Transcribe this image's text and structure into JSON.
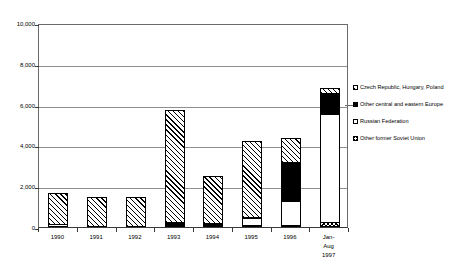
{
  "chart_data": {
    "type": "bar",
    "stacked": true,
    "title": "",
    "subtitle": "",
    "xlabel": "",
    "ylabel": "",
    "ylim": [
      0,
      10000
    ],
    "grid": true,
    "legend_position": "right",
    "categories": [
      "1990",
      "1991",
      "1992",
      "1993",
      "1994",
      "1995",
      "1996",
      "Jan-Aug\n1997"
    ],
    "ytick_labels": [
      "10,000",
      "8,000",
      "6,000",
      "4,000",
      "2,000",
      "0"
    ],
    "ytick_values": [
      10000,
      8000,
      6000,
      4000,
      2000,
      0
    ],
    "series": [
      {
        "name": "Other former Soviet Union",
        "pattern": "cross-hatch",
        "values": [
          0,
          0,
          0,
          0,
          0,
          60,
          110,
          260
        ]
      },
      {
        "name": "Russian Federation",
        "pattern": "white",
        "values": [
          170,
          0,
          0,
          0,
          0,
          330,
          1190,
          5280
        ]
      },
      {
        "name": "Other central and eastern Europe",
        "pattern": "black",
        "values": [
          0,
          0,
          0,
          260,
          220,
          30,
          1880,
          1030
        ]
      },
      {
        "name": "Czech Republic, Hungary, Poland",
        "pattern": "diagonal-hatch",
        "values": [
          1520,
          1490,
          1480,
          5480,
          2290,
          3740,
          1170,
          250
        ]
      }
    ],
    "totals": [
      1690,
      1490,
      1480,
      5740,
      2510,
      4160,
      4350,
      6820
    ]
  },
  "legend": {
    "entries": [
      {
        "label": "Czech Republic, Hungary, Poland",
        "pattern": "diagonal-hatch"
      },
      {
        "label": "Other central and eastern Europe",
        "pattern": "black"
      },
      {
        "label": "Russian Federation",
        "pattern": "white"
      },
      {
        "label": "Other former Soviet Union",
        "pattern": "cross-hatch"
      }
    ]
  },
  "colors": {
    "axis": "#3a3a3a",
    "grid": "#8f8f8f",
    "frame": "#6a6a6a",
    "ink": "#000000",
    "background": "#ffffff"
  }
}
